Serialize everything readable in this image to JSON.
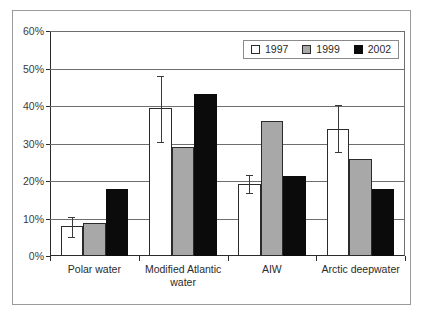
{
  "chart_data": {
    "type": "bar",
    "title": "",
    "subtitle": "",
    "xlabel": "",
    "ylabel": "",
    "ylim": [
      0,
      60
    ],
    "yticks": [
      "0%",
      "10%",
      "20%",
      "30%",
      "40%",
      "50%",
      "60%"
    ],
    "ytick_values": [
      0,
      10,
      20,
      30,
      40,
      50,
      60
    ],
    "grid": true,
    "legend_position": "top-right",
    "categories": [
      "Polar water",
      "Modified Atlantic\nwater",
      "AIW",
      "Arctic deepwater"
    ],
    "series": [
      {
        "name": "1997",
        "color": "#ffffff",
        "values": [
          8.0,
          39.5,
          19.3,
          34.0
        ],
        "error_low": [
          5.0,
          30.5,
          16.8,
          27.8
        ],
        "error_high": [
          10.5,
          48.0,
          21.5,
          40.3
        ]
      },
      {
        "name": "1999",
        "color": "#a8a8a8",
        "values": [
          8.9,
          29.0,
          36.0,
          26.0
        ],
        "error_low": [
          null,
          null,
          null,
          null
        ],
        "error_high": [
          null,
          null,
          null,
          null
        ]
      },
      {
        "name": "2002",
        "color": "#0b0b0b",
        "values": [
          17.8,
          43.3,
          21.3,
          17.8
        ],
        "error_low": [
          null,
          null,
          null,
          null
        ],
        "error_high": [
          null,
          null,
          null,
          null
        ]
      }
    ],
    "legend": [
      {
        "label": "1997",
        "swatch": "white-square-outline"
      },
      {
        "label": "1999",
        "swatch": "gray-square"
      },
      {
        "label": "2002",
        "swatch": "black-square"
      }
    ]
  }
}
